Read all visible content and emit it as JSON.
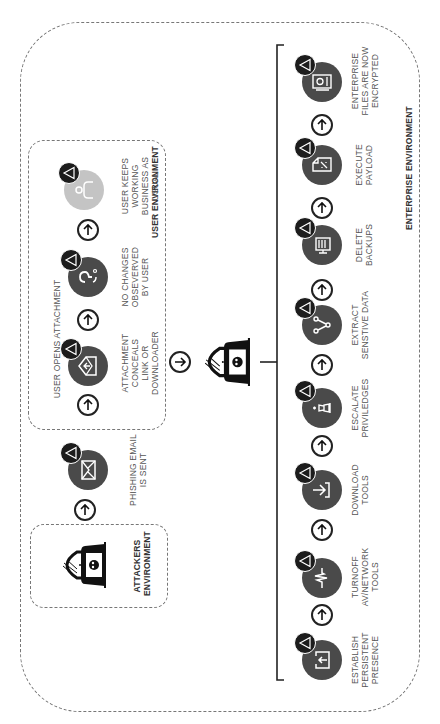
{
  "environments": {
    "attackers": "ATTACKERS ENVIRONMENT",
    "user": "USER ENVIRONMENT",
    "enterprise": "ENTERPRISE ENVIRONMENT"
  },
  "user_flow": {
    "group_label": "USER OPENS ATTACHMENT",
    "steps": [
      {
        "label": "PHISHING EMAIL IS SENT",
        "icon": "envelope-icon"
      },
      {
        "label": "ATTACHMENT CONCEALS LINK OR DOWNLOADER",
        "icon": "open-envelope-icon"
      },
      {
        "label": "NO CHANGES OBSEVERVED BY USER",
        "icon": "question-icon"
      },
      {
        "label": "USER KEEPS WORKING BUSINESS AS USUAL",
        "icon": "user-icon"
      }
    ]
  },
  "enterprise_flow": {
    "steps": [
      {
        "label": "ESTABLISH PERSISTENT PRESENCE",
        "icon": "upload-box-icon"
      },
      {
        "label": "TURNOFF AV/NETWORK TOOLS",
        "icon": "pulse-icon"
      },
      {
        "label": "DOWNLOAD TOOLS",
        "icon": "download-icon"
      },
      {
        "label": "ESCALATE PRIVILEDGES",
        "icon": "chess-king-icon"
      },
      {
        "label": "EXTRACT SENSTIVE DATA",
        "icon": "share-nodes-icon"
      },
      {
        "label": "DELETE BACKUPS",
        "icon": "trash-icon"
      },
      {
        "label": "EXECUTE PAYLOAD",
        "icon": "script-file-icon"
      },
      {
        "label": "ENTERPRISE FILES ARE NOW ENCRYPTED",
        "icon": "encrypted-drive-icon"
      }
    ]
  },
  "colors": {
    "node": "#4a4a4a",
    "node_light": "#c4c4c4",
    "warning_badge": "#1c1c1c",
    "line": "#222222",
    "dashed_border": "#777777"
  }
}
